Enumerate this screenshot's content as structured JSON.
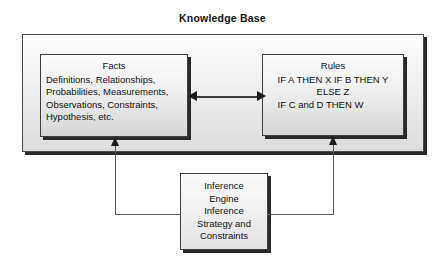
{
  "diagram": {
    "title": "Knowledge Base",
    "facts": {
      "heading": "Facts",
      "lines": [
        "Definitions, Relationships,",
        "Probabilities, Measurements,",
        "Observations, Constraints,",
        "Hypothesis, etc."
      ]
    },
    "rules": {
      "heading": "Rules",
      "lines": [
        "IF A THEN X",
        "IF B THEN Y",
        "ELSE Z",
        "IF C and D THEN W"
      ]
    },
    "inference_engine": {
      "lines": [
        "Inference",
        "Engine",
        "Inference",
        "Strategy and",
        "Constraints"
      ]
    },
    "connectors": {
      "facts_rules": "bidirectional-arrow",
      "engine_to_facts": "arrow-up",
      "engine_to_rules": "arrow-up"
    },
    "colors": {
      "line": "#5a5a5a",
      "arrow": "#1c1c1c",
      "border": "#3d3d3d",
      "shadow": "#2a2a2a",
      "background": "#ffffff"
    }
  }
}
